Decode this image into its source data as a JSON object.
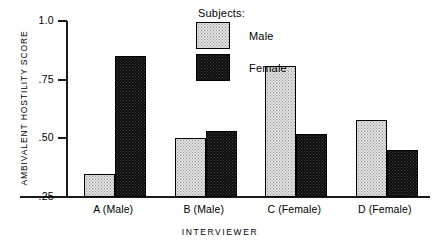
{
  "legend": {
    "title": "Subjects:",
    "entries": [
      {
        "label": "Male",
        "swatch": "light-stipple"
      },
      {
        "label": "Female",
        "swatch": "dark-stipple"
      }
    ]
  },
  "axes": {
    "ylabel": "AMBIVALENT HOSTILITY SCORE",
    "xlabel": "INTERVIEWER",
    "yticks": [
      "1.0",
      ".75",
      ".50",
      ".25"
    ]
  },
  "chart_data": {
    "type": "bar",
    "title": "",
    "xlabel": "INTERVIEWER",
    "ylabel": "AMBIVALENT HOSTILITY SCORE",
    "categories": [
      "A (Male)",
      "B (Male)",
      "C (Female)",
      "D (Female)"
    ],
    "series": [
      {
        "name": "Male",
        "values": [
          0.35,
          0.5,
          0.81,
          0.58
        ]
      },
      {
        "name": "Female",
        "values": [
          0.85,
          0.53,
          0.52,
          0.45
        ]
      }
    ],
    "ylim": [
      0.25,
      1.0
    ],
    "ytick_values": [
      1.0,
      0.75,
      0.5,
      0.25
    ],
    "ytick_labels": [
      "1.0",
      ".75",
      ".50",
      ".25"
    ],
    "grid": false,
    "legend_position": "top-center",
    "legend_title": "Subjects:"
  }
}
